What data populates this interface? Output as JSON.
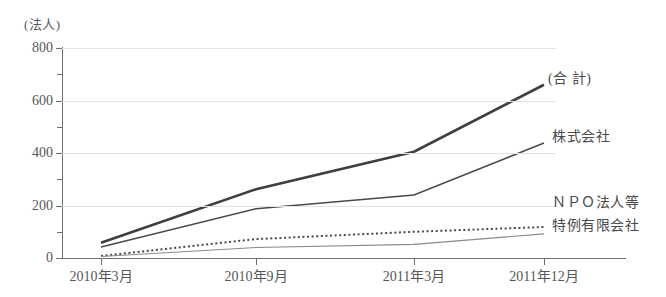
{
  "chart_data": {
    "type": "line",
    "title": "",
    "subtitle": "",
    "unit_label": "(法人)",
    "xlabel": "",
    "ylabel": "",
    "categories": [
      "2010年3月",
      "2010年9月",
      "2011年3月",
      "2011年12月"
    ],
    "ylim": [
      0,
      800
    ],
    "yticks": [
      0,
      200,
      400,
      600,
      800
    ],
    "ytick_labels": [
      "0",
      "200",
      "400",
      "600",
      "800"
    ],
    "yminor_ticks": [
      100,
      300,
      500,
      700
    ],
    "grid": true,
    "legend_position": "right-inline",
    "series": [
      {
        "name": "(合 計)",
        "style": "solid-thick",
        "color": "#3f3f3f",
        "values": [
          58,
          262,
          405,
          660
        ]
      },
      {
        "name": "株式会社",
        "style": "solid",
        "color": "#4a4a4a",
        "values": [
          42,
          188,
          240,
          438
        ]
      },
      {
        "name": "ＮＰＯ法人等",
        "style": "dotted",
        "color": "#4a4a4a",
        "values": [
          8,
          72,
          100,
          118
        ]
      },
      {
        "name": "特例有限会社",
        "style": "solid-thin",
        "color": "#8a8a8a",
        "values": [
          6,
          40,
          52,
          92
        ]
      }
    ]
  },
  "series_labels": {
    "total": "(合 計)",
    "kabushiki": "株式会社",
    "npo": "ＮＰＯ法人等",
    "tokurei": "特例有限会社"
  }
}
